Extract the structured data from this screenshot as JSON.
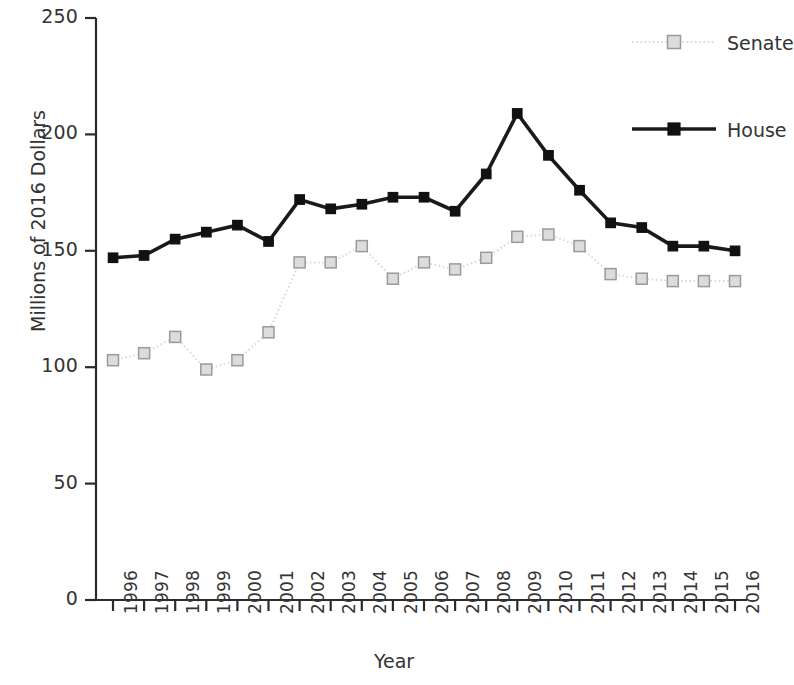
{
  "chart_data": {
    "type": "line",
    "title": "",
    "xlabel": "Year",
    "ylabel": "Millions of 2016 Dollars",
    "xlim": [
      1996,
      2016
    ],
    "ylim": [
      0,
      250
    ],
    "yticks": [
      0,
      50,
      100,
      150,
      200,
      250
    ],
    "grid": false,
    "legend_position": "top-right",
    "categories": [
      "1996",
      "1997",
      "1998",
      "1999",
      "2000",
      "2001",
      "2002",
      "2003",
      "2004",
      "2005",
      "2006",
      "2007",
      "2008",
      "2009",
      "2010",
      "2011",
      "2012",
      "2013",
      "2014",
      "2015",
      "2016"
    ],
    "x": [
      1996,
      1997,
      1998,
      1999,
      2000,
      2001,
      2002,
      2003,
      2004,
      2005,
      2006,
      2007,
      2008,
      2009,
      2010,
      2011,
      2012,
      2013,
      2014,
      2015,
      2016
    ],
    "series": [
      {
        "name": "Senate",
        "color": "#d9d9d9",
        "marker_face": "#dcdcdc",
        "marker_edge": "#9a9a9a",
        "linestyle": "dotted",
        "values": [
          103,
          106,
          113,
          99,
          103,
          115,
          145,
          145,
          152,
          138,
          145,
          142,
          147,
          156,
          157,
          152,
          140,
          138,
          137,
          137,
          137
        ]
      },
      {
        "name": "House",
        "color": "#1a1a1a",
        "marker_face": "#111111",
        "marker_edge": "#111111",
        "linestyle": "solid",
        "values": [
          147,
          148,
          155,
          158,
          161,
          154,
          172,
          168,
          170,
          173,
          173,
          167,
          183,
          209,
          191,
          176,
          162,
          160,
          152,
          152,
          150
        ]
      }
    ]
  },
  "legend": {
    "entries": [
      {
        "label": "Senate"
      },
      {
        "label": "House"
      }
    ]
  },
  "axis": {
    "y_title": "Millions of 2016 Dollars",
    "x_title": "Year"
  }
}
